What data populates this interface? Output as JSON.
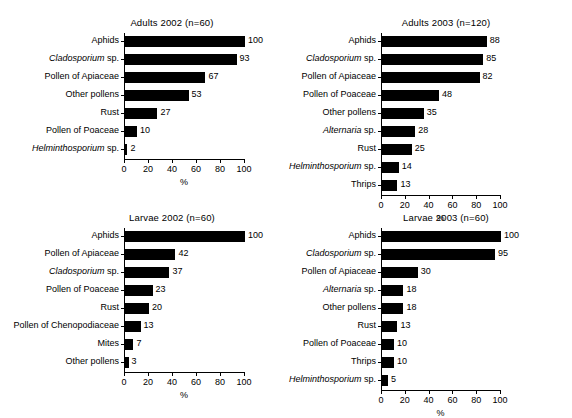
{
  "figure": {
    "background": "#ffffff",
    "bar_color": "#000000",
    "axis_color": "#000000"
  },
  "chart_data": [
    {
      "type": "bar",
      "orientation": "horizontal",
      "title": "Adults 2002 (n=60)",
      "xlabel": "%",
      "ylabel": "",
      "xlim": [
        0,
        100
      ],
      "xticks": [
        0,
        20,
        40,
        60,
        80,
        100
      ],
      "grid": false,
      "legend": null,
      "categories": [
        "Aphids",
        "Cladosporium sp.",
        "Pollen of Apiaceae",
        "Other pollens",
        "Rust",
        "Pollen of Poaceae",
        "Helminthosporium sp."
      ],
      "categories_italic_prefix": [
        "",
        "Cladosporium",
        "",
        "",
        "",
        "",
        "Helminthosporium"
      ],
      "values": [
        100,
        93,
        67,
        53,
        27,
        10,
        2
      ]
    },
    {
      "type": "bar",
      "orientation": "horizontal",
      "title": "Adults 2003 (n=120)",
      "xlabel": "%",
      "ylabel": "",
      "xlim": [
        0,
        100
      ],
      "xticks": [
        0,
        20,
        40,
        60,
        80,
        100
      ],
      "grid": false,
      "legend": null,
      "categories": [
        "Aphids",
        "Cladosporium sp.",
        "Pollen of Apiaceae",
        "Pollen of Poaceae",
        "Other pollens",
        "Alternaria sp.",
        "Rust",
        "Helminthosporium sp.",
        "Thrips"
      ],
      "categories_italic_prefix": [
        "",
        "Cladosporium",
        "",
        "",
        "",
        "Alternaria",
        "",
        "Helminthosporium",
        ""
      ],
      "values": [
        88,
        85,
        82,
        48,
        35,
        28,
        25,
        14,
        13
      ]
    },
    {
      "type": "bar",
      "orientation": "horizontal",
      "title": "Larvae 2002 (n=60)",
      "xlabel": "%",
      "ylabel": "",
      "xlim": [
        0,
        100
      ],
      "xticks": [
        0,
        20,
        40,
        60,
        80,
        100
      ],
      "grid": false,
      "legend": null,
      "categories": [
        "Aphids",
        "Pollen of Apiaceae",
        "Cladosporium sp.",
        "Pollen of Poaceae",
        "Rust",
        "Pollen of Chenopodiaceae",
        "Mites",
        "Other pollens"
      ],
      "categories_italic_prefix": [
        "",
        "",
        "Cladosporium",
        "",
        "",
        "",
        "",
        ""
      ],
      "values": [
        100,
        42,
        37,
        23,
        20,
        13,
        7,
        3
      ]
    },
    {
      "type": "bar",
      "orientation": "horizontal",
      "title": "Larvae 2003 (n=60)",
      "xlabel": "%",
      "ylabel": "",
      "xlim": [
        0,
        100
      ],
      "xticks": [
        0,
        20,
        40,
        60,
        80,
        100
      ],
      "grid": false,
      "legend": null,
      "categories": [
        "Aphids",
        "Cladosporium sp.",
        "Pollen of Apiaceae",
        "Alternaria sp.",
        "Other pollens",
        "Rust",
        "Pollen of Poaceae",
        "Thrips",
        "Helminthosporium sp."
      ],
      "categories_italic_prefix": [
        "",
        "Cladosporium",
        "",
        "Alternaria",
        "",
        "",
        "",
        "",
        "Helminthosporium"
      ],
      "values": [
        100,
        95,
        30,
        18,
        18,
        13,
        10,
        10,
        5
      ]
    }
  ]
}
